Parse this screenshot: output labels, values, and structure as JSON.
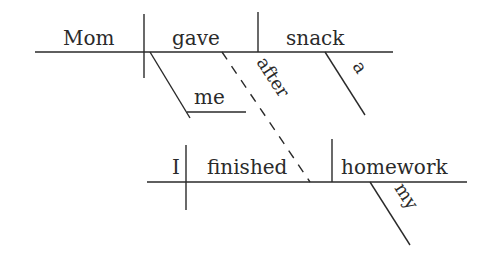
{
  "diagram": {
    "type": "sentence-diagram",
    "main_clause": {
      "subject": "Mom",
      "verb": "gave",
      "direct_object": "snack",
      "direct_object_modifier": "a",
      "indirect_object": "me"
    },
    "connector": "after",
    "subordinate_clause": {
      "subject": "I",
      "verb": "finished",
      "direct_object": "homework",
      "direct_object_modifier": "my"
    }
  }
}
